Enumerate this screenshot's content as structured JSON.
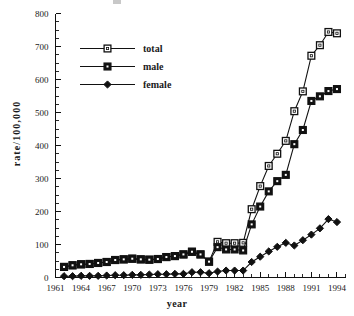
{
  "chart_data": {
    "type": "line",
    "title": "",
    "xlabel": "year",
    "ylabel": "rate/100,000",
    "xlim": [
      1961,
      1995
    ],
    "ylim": [
      0,
      800
    ],
    "grid": false,
    "legend_position": "upper-left",
    "x_major_ticks": [
      1961,
      1964,
      1967,
      1970,
      1973,
      1976,
      1979,
      1982,
      1985,
      1988,
      1991,
      1994
    ],
    "x_tick_labels": [
      "1961",
      "1964",
      "1967",
      "1970",
      "1973",
      "1976",
      "1979",
      "1982",
      "1985",
      "1988",
      "1991",
      "1994"
    ],
    "y_major_ticks": [
      0,
      100,
      200,
      300,
      400,
      500,
      600,
      700,
      800
    ],
    "y_tick_labels": [
      "0",
      "100",
      "200",
      "300",
      "400",
      "500",
      "600",
      "700",
      "800"
    ],
    "y_minor_tick_step": 25,
    "x": [
      1962,
      1963,
      1964,
      1965,
      1966,
      1967,
      1968,
      1969,
      1970,
      1971,
      1972,
      1973,
      1974,
      1975,
      1976,
      1977,
      1978,
      1979,
      1980,
      1981,
      1982,
      1983,
      1984,
      1985,
      1986,
      1987,
      1988,
      1989,
      1990,
      1991,
      1992,
      1993,
      1994
    ],
    "series": [
      {
        "name": "total",
        "marker": "open-square",
        "color": "#111111",
        "values": [
          32,
          37,
          40,
          41,
          44,
          47,
          53,
          55,
          57,
          55,
          54,
          56,
          62,
          65,
          70,
          78,
          70,
          48,
          108,
          104,
          104,
          105,
          207,
          277,
          338,
          375,
          414,
          504,
          564,
          672,
          704,
          744,
          740
        ]
      },
      {
        "name": "male",
        "marker": "filled-square",
        "color": "#111111",
        "values": [
          32,
          37,
          40,
          41,
          44,
          47,
          53,
          55,
          57,
          55,
          54,
          56,
          62,
          65,
          70,
          78,
          70,
          48,
          92,
          85,
          85,
          82,
          161,
          215,
          261,
          292,
          311,
          404,
          447,
          535,
          549,
          565,
          571
        ]
      },
      {
        "name": "female",
        "marker": "filled-diamond",
        "color": "#111111",
        "values": [
          4,
          4,
          5,
          5,
          5,
          6,
          7,
          7,
          8,
          8,
          9,
          10,
          10,
          11,
          11,
          16,
          16,
          13,
          18,
          21,
          21,
          21,
          47,
          63,
          79,
          93,
          105,
          97,
          113,
          130,
          149,
          177,
          168
        ]
      }
    ]
  },
  "legend": {
    "entries": [
      {
        "label": "total",
        "marker": "open-square"
      },
      {
        "label": "male",
        "marker": "filled-square"
      },
      {
        "label": "female",
        "marker": "filled-diamond"
      }
    ]
  },
  "axes": {
    "x_title": "year",
    "y_title": "rate/100,000"
  }
}
